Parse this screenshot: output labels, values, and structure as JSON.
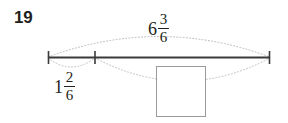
{
  "problem": {
    "number": "19",
    "type": "number-line-missing-addend"
  },
  "number_line": {
    "labels": {
      "total": {
        "whole": "6",
        "numerator": "3",
        "denominator": "6",
        "text": "6 3/6",
        "position": "above-line-center",
        "describes": "whole span from left tick to right tick"
      },
      "known_part": {
        "whole": "1",
        "numerator": "2",
        "denominator": "6",
        "text": "1 2/6",
        "position": "below-line-left",
        "describes": "segment from left tick to middle tick"
      },
      "unknown_part": {
        "text": "",
        "position": "below-line-right",
        "describes": "empty answer box for segment from middle tick to right tick"
      }
    },
    "ticks": [
      {
        "name": "left-endpoint",
        "x": 48
      },
      {
        "name": "middle-tick",
        "x": 95
      },
      {
        "name": "right-endpoint",
        "x": 270
      }
    ],
    "answer_box": {
      "value": "",
      "placeholder": ""
    }
  },
  "colors": {
    "ink": "#231f20",
    "line": "#3a3a3a",
    "arc": "#b9b9b9",
    "box_border": "#9a9a9a",
    "background": "#ffffff"
  },
  "icons": {
    "upper_arc": "arc-brace-up-icon",
    "lower_arc_left": "arc-brace-down-small-icon",
    "lower_arc_right": "arc-brace-down-large-icon"
  }
}
